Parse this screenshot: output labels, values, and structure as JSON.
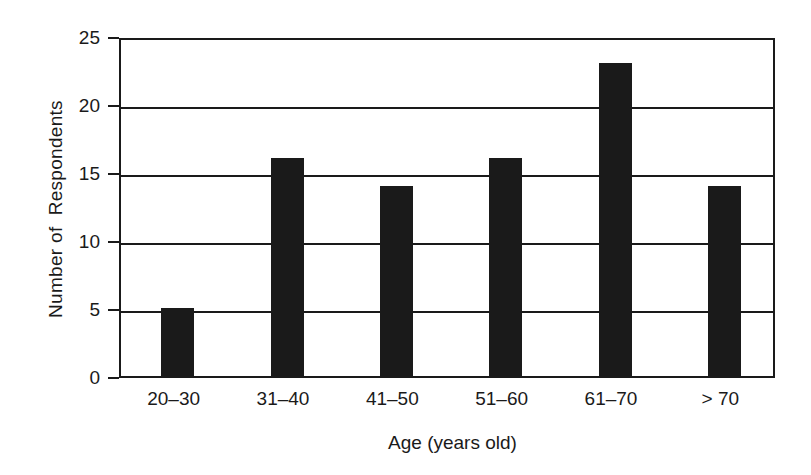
{
  "chart_data": {
    "type": "bar",
    "title": "",
    "subtitle": "",
    "xlabel": "Age (years old)",
    "ylabel": "Number of  Respondents",
    "categories": [
      "20–30",
      "31–40",
      "41–50",
      "51–60",
      "61–70",
      "> 70"
    ],
    "values": [
      5,
      16,
      14,
      16,
      23,
      14
    ],
    "series": [
      {
        "name": "Number of Respondents",
        "values": [
          5,
          16,
          14,
          16,
          23,
          14
        ]
      }
    ],
    "ylim": [
      0,
      25
    ],
    "yticks": [
      0,
      5,
      10,
      15,
      20,
      25
    ],
    "ytick_labels": [
      "0",
      "5",
      "10",
      "15",
      "20",
      "25"
    ],
    "xlim_note": "categorical",
    "grid": "horizontal",
    "gridlines_at": [
      5,
      10,
      15,
      20,
      25
    ],
    "legend": "none",
    "legend_position": "none",
    "bar_color": "#1a1a1a",
    "axis_color": "#1a1a1a",
    "background_color": "#ffffff",
    "annotations": []
  }
}
